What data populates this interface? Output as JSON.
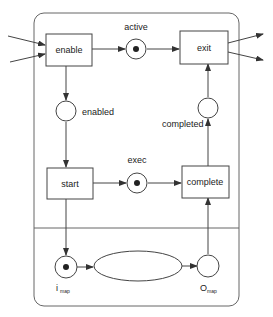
{
  "diagram": {
    "type": "petri-net",
    "transitions": {
      "enable": "enable",
      "exit": "exit",
      "start": "start",
      "complete": "complete"
    },
    "places": {
      "active": {
        "label": "active",
        "token": true
      },
      "enabled": {
        "label": "enabled",
        "token": false
      },
      "completed": {
        "label": "completed",
        "token": false
      },
      "exec": {
        "label": "exec",
        "token": true
      },
      "i_map": {
        "label_main": "i",
        "label_sub": "map",
        "token": true
      },
      "o_map": {
        "label_main": "O",
        "label_sub": "map",
        "token": false
      }
    },
    "subnet": {
      "label": ""
    },
    "colors": {
      "stroke": "#444444",
      "frame": "#666666",
      "token": "#222222",
      "background": "#ffffff"
    }
  }
}
